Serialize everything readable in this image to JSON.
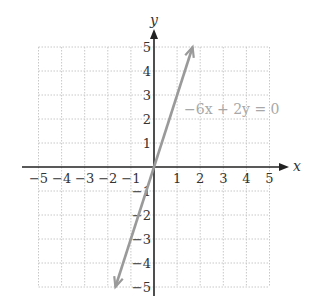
{
  "chart_data": {
    "type": "line",
    "title": "",
    "equation_label": "−6x + 2y = 0",
    "xlabel": "x",
    "ylabel": "y",
    "xlim": [
      -5,
      5
    ],
    "ylim": [
      -5,
      5
    ],
    "grid": true,
    "x_ticks": [
      "−5",
      "−4",
      "−3",
      "−2",
      "−1",
      "1",
      "2",
      "3",
      "4",
      "5"
    ],
    "y_ticks": [
      "5",
      "4",
      "3",
      "2",
      "1",
      "−1",
      "−2",
      "−3",
      "−4",
      "−5"
    ],
    "series": [
      {
        "name": "−6x + 2y = 0",
        "equation": "y = 3x",
        "x": [
          -1.67,
          0,
          1.67
        ],
        "y": [
          -5,
          0,
          5
        ],
        "color": "#9a9a9a",
        "arrows": "both"
      }
    ]
  }
}
